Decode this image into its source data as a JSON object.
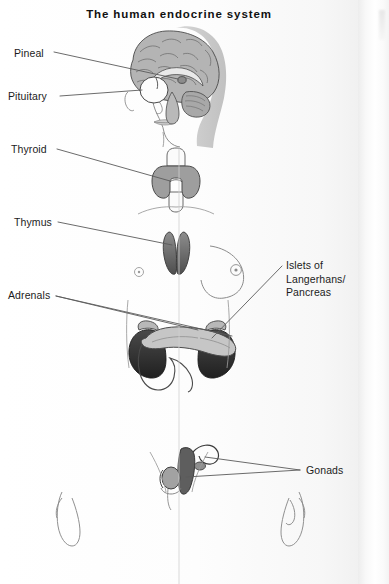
{
  "page": {
    "title": "The human endocrine system",
    "kind": "anatomical-diagram",
    "width": 389,
    "height": 584
  },
  "colors": {
    "paper": "#fdfdfd",
    "ink": "#1c1c1c",
    "leader_line": "#555555",
    "body_outline": "#7a7a7a",
    "body_fill_left": "#ffffff",
    "body_fill_right": "#dcdcdc",
    "organ_mid_grey": "#9a9a9a",
    "organ_dark_grey": "#3c3c3c",
    "organ_light_grey": "#c8c8c8",
    "brain_grey": "#b4b4b4",
    "gutter_shadow": "#ededed"
  },
  "labels": {
    "left": [
      {
        "id": "pineal",
        "text": "Pineal",
        "x": 14,
        "y": 47
      },
      {
        "id": "pituitary",
        "text": "Pituitary",
        "x": 8,
        "y": 90
      },
      {
        "id": "thyroid",
        "text": "Thyroid",
        "x": 11,
        "y": 144
      },
      {
        "id": "thymus",
        "text": "Thymus",
        "x": 14,
        "y": 217
      },
      {
        "id": "adrenals",
        "text": "Adrenals",
        "x": 8,
        "y": 289
      }
    ],
    "right": [
      {
        "id": "islets",
        "lines": [
          "Islets of",
          "Langerhans/",
          "Pancreas"
        ],
        "x": 285,
        "y": 258
      },
      {
        "id": "gonads",
        "lines": [
          "Gonads"
        ],
        "x": 305,
        "y": 466
      }
    ]
  },
  "leader_lines": [
    {
      "id": "pineal-leader",
      "from": [
        54,
        52
      ],
      "to": [
        163,
        68
      ]
    },
    {
      "id": "pituitary-leader",
      "from": [
        58,
        96
      ],
      "to": [
        157,
        87
      ]
    },
    {
      "id": "thyroid-leader",
      "from": [
        57,
        149
      ],
      "to": [
        168,
        178
      ]
    },
    {
      "id": "thymus-leader",
      "from": [
        58,
        222
      ],
      "to": [
        170,
        243
      ]
    },
    {
      "id": "adrenals-leader-a",
      "from": [
        56,
        296
      ],
      "to": [
        198,
        329
      ]
    },
    {
      "id": "adrenals-leader-b",
      "from": [
        56,
        296
      ],
      "to": [
        232,
        334
      ]
    },
    {
      "id": "islets-leader",
      "from": [
        282,
        266
      ],
      "to": [
        211,
        337
      ]
    },
    {
      "id": "gonads-leader-a",
      "from": [
        300,
        470
      ],
      "to": [
        203,
        456
      ]
    },
    {
      "id": "gonads-leader-b",
      "from": [
        300,
        470
      ],
      "to": [
        186,
        477
      ]
    }
  ],
  "organs": [
    {
      "id": "brain",
      "name": "brain-sagittal-section",
      "region": "head"
    },
    {
      "id": "pineal",
      "name": "pineal-gland",
      "region": "head"
    },
    {
      "id": "pituitary",
      "name": "pituitary-gland",
      "region": "head"
    },
    {
      "id": "thyroid",
      "name": "thyroid-gland",
      "region": "neck"
    },
    {
      "id": "thymus",
      "name": "thymus-gland",
      "region": "chest"
    },
    {
      "id": "adrenals",
      "name": "adrenal-glands",
      "region": "abdomen"
    },
    {
      "id": "kidneys",
      "name": "kidneys",
      "region": "abdomen"
    },
    {
      "id": "pancreas",
      "name": "pancreas-duodenum",
      "region": "abdomen"
    },
    {
      "id": "ovary",
      "name": "ovary-uterus",
      "region": "pelvis"
    },
    {
      "id": "testis",
      "name": "testis",
      "region": "pelvis"
    }
  ],
  "figure_notes": {
    "split_body": "left half male (white), right half female (grey tint)",
    "view": "anterior full-body outline with head in profile"
  }
}
